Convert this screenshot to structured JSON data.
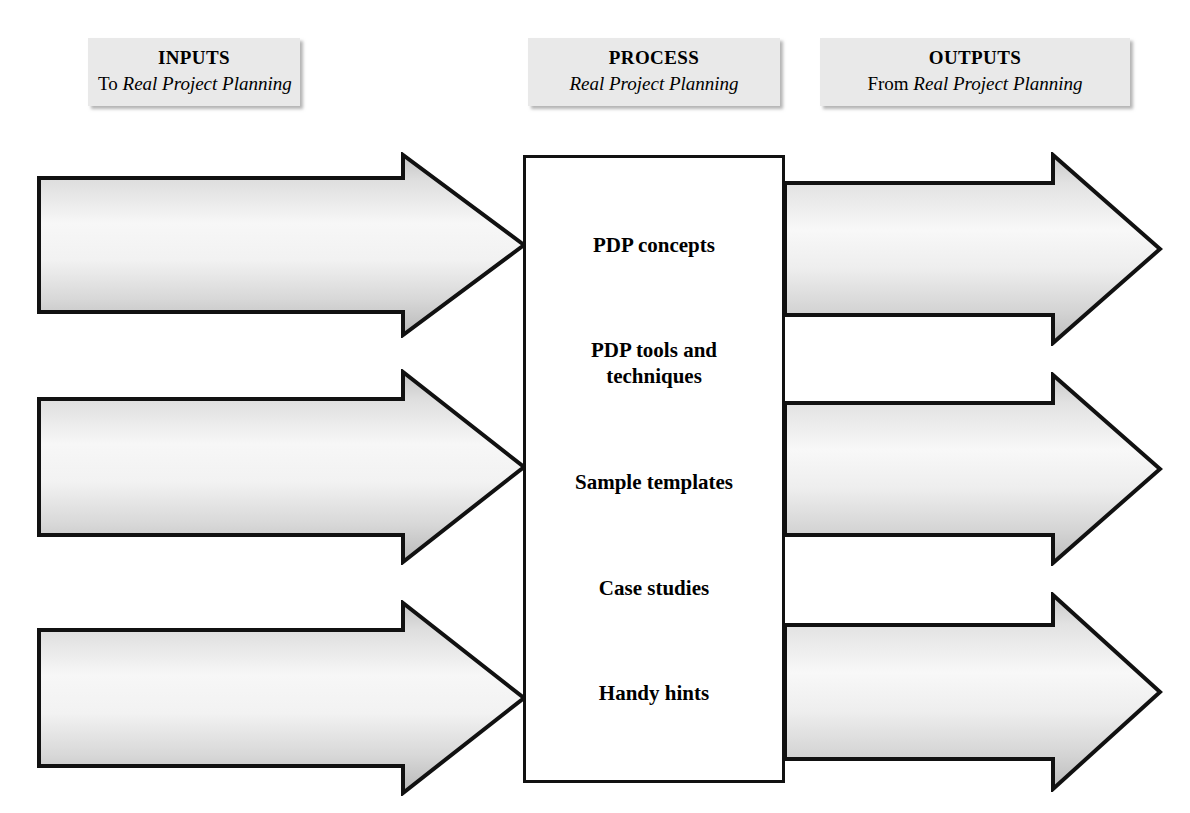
{
  "headers": {
    "inputs": {
      "title": "INPUTS",
      "sub_prefix": "To ",
      "sub_italic": "Real Project Planning"
    },
    "process": {
      "title": "PROCESS",
      "sub_prefix": "",
      "sub_italic": "Real Project Planning"
    },
    "outputs": {
      "title": "OUTPUTS",
      "sub_prefix": "From ",
      "sub_italic": "Real Project Planning"
    }
  },
  "inputs": [
    {
      "title": "Project Management Toolkit",
      "desc_prefix": "All project lifecycle and ‘How?’ concepts introduced in ",
      "desc_italic": "Project Management Toolkit",
      "desc_suffix": ""
    },
    {
      "title": "Project management expertise",
      "desc_prefix": "Input from Project Managers based on successful planning and then delivery of projects over many years",
      "desc_italic": "",
      "desc_suffix": ""
    },
    {
      "title": "Project management experience",
      "desc_prefix": "Detailed case studies to show what can go wrong and how planning supports success",
      "desc_italic": "",
      "desc_suffix": ""
    }
  ],
  "process": {
    "items": [
      "PDP concepts",
      "PDP tools and techniques",
      "Sample templates",
      "Case studies",
      "Handy hints"
    ]
  },
  "outputs": [
    {
      "title": "PDP knowledge",
      "desc_prefix": "Expert level education for the reader who needs to plan",
      "desc_italic": "",
      "desc_suffix": ""
    },
    {
      "title": "PDP template",
      "desc_prefix": "A planning tool which the reader can use, adapt and add to",
      "desc_italic": "",
      "desc_suffix": ""
    },
    {
      "title": "Project success",
      "desc_prefix": "An increase in reader confidence in their ability to successfully plan projects",
      "desc_italic": "",
      "desc_suffix": ""
    }
  ],
  "colors": {
    "outline": "#111111",
    "arrow_light": "#f6f6f6",
    "arrow_mid": "#d4d4d4",
    "arrow_dark": "#b9b9b9",
    "header_fill": "#e9e9e9",
    "canvas": "#ffffff"
  }
}
